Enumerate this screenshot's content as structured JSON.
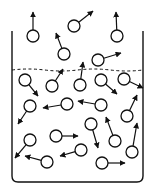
{
  "diagram": {
    "colors": {
      "stroke": "#111111",
      "background": "#ffffff"
    },
    "container": {
      "left": 12,
      "right": 143,
      "top": 31,
      "bottom": 182,
      "corner_radius": 6
    },
    "surface": {
      "y": 70,
      "style": "dashed"
    },
    "molecule_radius": 6,
    "molecules": [
      {
        "id": 1,
        "cx": 33,
        "cy": 36,
        "tx": 33,
        "ty": 12,
        "region": "vapor"
      },
      {
        "id": 2,
        "cx": 74,
        "cy": 26,
        "tx": 93,
        "ty": 11,
        "region": "vapor"
      },
      {
        "id": 3,
        "cx": 117,
        "cy": 36,
        "tx": 116,
        "ty": 12,
        "region": "vapor"
      },
      {
        "id": 4,
        "cx": 64,
        "cy": 54,
        "tx": 56,
        "ty": 33,
        "region": "vapor"
      },
      {
        "id": 5,
        "cx": 98,
        "cy": 60,
        "tx": 121,
        "ty": 53,
        "region": "vapor"
      },
      {
        "id": 6,
        "cx": 25,
        "cy": 80,
        "tx": 38,
        "ty": 96,
        "region": "liquid"
      },
      {
        "id": 7,
        "cx": 52,
        "cy": 86,
        "tx": 63,
        "ty": 69,
        "region": "liquid"
      },
      {
        "id": 8,
        "cx": 80,
        "cy": 85,
        "tx": 83,
        "ty": 62,
        "region": "liquid"
      },
      {
        "id": 9,
        "cx": 101,
        "cy": 80,
        "tx": 117,
        "ty": 94,
        "region": "liquid"
      },
      {
        "id": 10,
        "cx": 124,
        "cy": 79,
        "tx": 143,
        "ty": 88,
        "region": "liquid"
      },
      {
        "id": 11,
        "cx": 30,
        "cy": 106,
        "tx": 18,
        "ty": 124,
        "region": "liquid"
      },
      {
        "id": 12,
        "cx": 67,
        "cy": 104,
        "tx": 43,
        "ty": 108,
        "region": "liquid"
      },
      {
        "id": 13,
        "cx": 101,
        "cy": 105,
        "tx": 78,
        "ty": 101,
        "region": "liquid"
      },
      {
        "id": 14,
        "cx": 127,
        "cy": 116,
        "tx": 137,
        "ty": 95,
        "region": "liquid"
      },
      {
        "id": 15,
        "cx": 91,
        "cy": 124,
        "tx": 98,
        "ty": 148,
        "region": "liquid"
      },
      {
        "id": 16,
        "cx": 56,
        "cy": 136,
        "tx": 78,
        "ty": 136,
        "region": "liquid"
      },
      {
        "id": 17,
        "cx": 30,
        "cy": 140,
        "tx": 15,
        "ty": 158,
        "region": "liquid"
      },
      {
        "id": 18,
        "cx": 81,
        "cy": 150,
        "tx": 60,
        "ty": 156,
        "region": "liquid"
      },
      {
        "id": 19,
        "cx": 115,
        "cy": 141,
        "tx": 106,
        "ty": 117,
        "region": "liquid"
      },
      {
        "id": 20,
        "cx": 132,
        "cy": 152,
        "tx": 137,
        "ty": 123,
        "region": "liquid"
      },
      {
        "id": 21,
        "cx": 47,
        "cy": 162,
        "tx": 25,
        "ty": 156,
        "region": "liquid"
      },
      {
        "id": 22,
        "cx": 102,
        "cy": 163,
        "tx": 125,
        "ty": 163,
        "region": "liquid"
      }
    ]
  }
}
